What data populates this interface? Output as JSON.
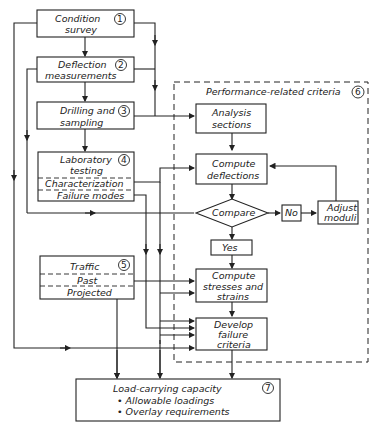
{
  "diagram": {
    "boxes": {
      "condition_survey": {
        "line1": "Condition",
        "line2": "survey",
        "num": "1"
      },
      "deflection_measurements": {
        "line1": "Deflection",
        "line2": "measurements",
        "num": "2"
      },
      "drilling_sampling": {
        "line1": "Drilling and",
        "line2": "sampling",
        "num": "3"
      },
      "laboratory_testing": {
        "line1": "Laboratory",
        "line2": "testing",
        "sub1": "Characterization",
        "sub2": "Failure modes",
        "num": "4"
      },
      "traffic": {
        "line1": "Traffic",
        "sub1": "Past",
        "sub2": "Projected",
        "num": "5"
      },
      "performance_group": {
        "title": "Performance-related criteria",
        "num": "6"
      },
      "analysis_sections": {
        "line1": "Analysis",
        "line2": "sections"
      },
      "compute_deflections": {
        "line1": "Compute",
        "line2": "deflections"
      },
      "compare": {
        "label": "Compare"
      },
      "no": {
        "label": "No"
      },
      "yes": {
        "label": "Yes"
      },
      "adjust_moduli": {
        "line1": "Adjust",
        "line2": "moduli"
      },
      "compute_stresses": {
        "line1": "Compute",
        "line2": "stresses and",
        "line3": "strains"
      },
      "develop_failure": {
        "line1": "Develop",
        "line2": "failure",
        "line3": "criteria"
      },
      "load_capacity": {
        "title": "Load-carrying capacity",
        "bullet1": "• Allowable loadings",
        "bullet2": "• Overlay requirements",
        "num": "7"
      }
    }
  }
}
